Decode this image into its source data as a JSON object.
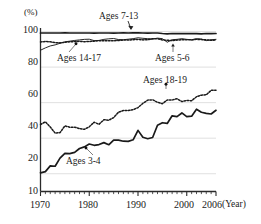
{
  "chart_data": {
    "type": "line",
    "title": "",
    "xlabel": "(Year)",
    "ylabel": "(%)",
    "xlim": [
      1970,
      2006
    ],
    "ylim": [
      10,
      102
    ],
    "grid": true,
    "grid_values": [
      20,
      40,
      60,
      80,
      100
    ],
    "legend_position": "inline-annotations",
    "yticks": [
      "100",
      "80",
      "60",
      "40",
      "20",
      "10"
    ],
    "ytick_values": [
      100,
      80,
      60,
      40,
      20,
      10
    ],
    "xticks": [
      "1970",
      "1980",
      "1990",
      "2000",
      "2006"
    ],
    "xtick_values": [
      1970,
      1980,
      1990,
      2000,
      2006
    ],
    "x": [
      1970,
      1971,
      1972,
      1973,
      1974,
      1975,
      1976,
      1977,
      1978,
      1979,
      1980,
      1981,
      1982,
      1983,
      1984,
      1985,
      1986,
      1987,
      1988,
      1989,
      1990,
      1991,
      1992,
      1993,
      1994,
      1995,
      1996,
      1997,
      1998,
      1999,
      2000,
      2001,
      2002,
      2003,
      2004,
      2005,
      2006
    ],
    "series": [
      {
        "name": "Ages 7-13",
        "style": "solid-thick",
        "label": "Ages 7-13",
        "values": [
          99.2,
          99.2,
          99.2,
          99.2,
          99.2,
          99.3,
          99.2,
          99.2,
          99.2,
          99.2,
          99.2,
          99.1,
          99.2,
          99.2,
          99.2,
          99.1,
          99.2,
          99.3,
          99.2,
          99.3,
          99.3,
          99.2,
          99.1,
          99.2,
          99.2,
          98.9,
          98.7,
          98.9,
          98.8,
          98.9,
          98.8,
          98.9,
          98.8,
          98.7,
          98.9,
          98.8,
          98.9
        ]
      },
      {
        "name": "Ages 14-17",
        "style": "dashed",
        "label": "Ages 14-17",
        "values": [
          94.1,
          94.4,
          94.2,
          93.8,
          93.6,
          94.0,
          94.2,
          94.4,
          94.5,
          94.3,
          94.4,
          94.6,
          94.9,
          94.8,
          94.8,
          94.8,
          95.0,
          95.2,
          95.2,
          95.4,
          95.6,
          95.3,
          95.4,
          95.9,
          96.0,
          95.3,
          95.1,
          94.9,
          95.2,
          95.4,
          95.4,
          95.3,
          95.6,
          95.5,
          95.3,
          95.1,
          95.2
        ]
      },
      {
        "name": "Ages 5-6",
        "style": "solid-thin",
        "label": "Ages 5-6",
        "values": [
          89.5,
          90.8,
          91.9,
          92.5,
          93.4,
          94.2,
          94.6,
          95.0,
          95.3,
          95.6,
          95.7,
          94.9,
          95.0,
          95.6,
          95.9,
          96.1,
          95.5,
          95.4,
          95.7,
          96.0,
          96.5,
          96.2,
          96.0,
          95.8,
          96.3,
          96.0,
          94.0,
          95.4,
          95.6,
          96.0,
          95.6,
          95.4,
          96.0,
          95.8,
          94.9,
          95.4,
          95.6
        ]
      },
      {
        "name": "Ages 18-19",
        "style": "dashed",
        "label": "Ages 18-19",
        "values": [
          47.7,
          49.2,
          46.3,
          42.9,
          43.1,
          46.9,
          46.2,
          46.2,
          45.4,
          45.0,
          46.4,
          49.0,
          47.8,
          50.4,
          50.1,
          51.6,
          54.6,
          55.6,
          55.6,
          56.0,
          57.2,
          59.6,
          61.4,
          61.6,
          60.2,
          59.4,
          61.5,
          61.5,
          62.2,
          60.6,
          61.2,
          61.1,
          63.3,
          64.2,
          64.4,
          66.9,
          67.0
        ]
      },
      {
        "name": "Ages 3-4",
        "style": "solid-thick",
        "label": "Ages 3-4",
        "values": [
          20.5,
          21.2,
          24.4,
          24.2,
          28.8,
          31.5,
          31.3,
          32.0,
          34.2,
          35.1,
          36.7,
          36.0,
          36.4,
          37.5,
          36.3,
          38.9,
          38.9,
          38.3,
          38.2,
          39.1,
          44.4,
          40.5,
          39.7,
          40.4,
          47.3,
          48.7,
          48.3,
          52.6,
          52.1,
          54.2,
          52.1,
          52.4,
          56.3,
          54.6,
          54.0,
          53.6,
          55.7
        ]
      }
    ]
  },
  "annotations": [
    {
      "name": "ages-7-13",
      "text": "Ages 7-13"
    },
    {
      "name": "ages-14-17",
      "text": "Ages 14-17"
    },
    {
      "name": "ages-5-6",
      "text": "Ages 5-6"
    },
    {
      "name": "ages-18-19",
      "text": "Ages 18-19"
    },
    {
      "name": "ages-3-4",
      "text": "Ages 3-4"
    }
  ],
  "axes": {
    "y_unit": "(%)",
    "x_unit": "(Year)"
  }
}
